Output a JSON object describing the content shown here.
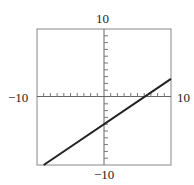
{
  "chart_data": {
    "type": "line",
    "title": "",
    "xlabel": "",
    "ylabel": "",
    "xlim": [
      -10,
      10
    ],
    "ylim": [
      -10,
      10
    ],
    "grid": false,
    "tick_spacing": 1,
    "tick_labels": {
      "x_min": "−10",
      "x_max": "10",
      "y_min": "−10",
      "y_max": "10"
    },
    "series": [
      {
        "name": "y = (2/3)x − 4",
        "x": [
          -9,
          10
        ],
        "y": [
          -10,
          2.67
        ]
      }
    ]
  }
}
